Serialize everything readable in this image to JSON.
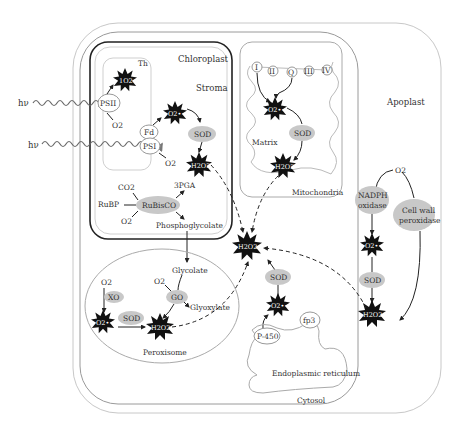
{
  "compartments": {
    "chloroplast": "Chloroplast",
    "stroma": "Stroma",
    "thylakoid": "Th",
    "mitochondria": "Mitochondria",
    "matrix": "Matrix",
    "apoplast": "Apoplast",
    "peroxisome": "Peroxisome",
    "er": "Endoplasmic reticulum",
    "cytosol": "Cytosol"
  },
  "light": {
    "hv1": "hν",
    "hv2": "hν"
  },
  "chloroplast": {
    "psii": "PSII",
    "psi": "PSI",
    "fd": "Fd",
    "o2_psii": "O2",
    "o2_psi": "O2",
    "singlet_o2": "1O2",
    "superoxide": "O2•−",
    "sod": "SOD",
    "h2o2": "H2O2",
    "co2": "CO2",
    "rubp": "RuBP",
    "o2_rubisco": "O2",
    "rubisco": "RuBisCO",
    "pga": "3PGA",
    "phosphoglycolate": "Phosphoglycolate"
  },
  "mitochondria": {
    "complexes": [
      "I",
      "II",
      "Q",
      "III",
      "IV"
    ],
    "superoxide": "O2•−",
    "sod": "SOD",
    "h2o2": "H2O2"
  },
  "peroxisome": {
    "glycolate": "Glycolate",
    "o2_go": "O2",
    "go": "GO",
    "glyoxylate": "Glyoxylate",
    "o2_xo": "O2",
    "xo": "XO",
    "superoxide": "O2•−",
    "sod": "SOD",
    "h2o2": "H2O2"
  },
  "cytosol": {
    "h2o2": "H2O2",
    "sod": "SOD",
    "superoxide": "O2•−",
    "p450": "P-450",
    "fp3": "fp3"
  },
  "apoplast": {
    "o2": "O2",
    "nadph_oxidase_1": "NADPH",
    "nadph_oxidase_2": "oxidase",
    "cell_wall_peroxidase_1": "Cell wall",
    "cell_wall_peroxidase_2": "peroxidase",
    "superoxide": "O2•−",
    "sod": "SOD",
    "h2o2": "H2O2"
  },
  "colors": {
    "membrane_dark": "#222222",
    "membrane_light": "#b8b8b8",
    "enzyme_fill": "#c8c8c8",
    "ros_fill": "#111111"
  }
}
